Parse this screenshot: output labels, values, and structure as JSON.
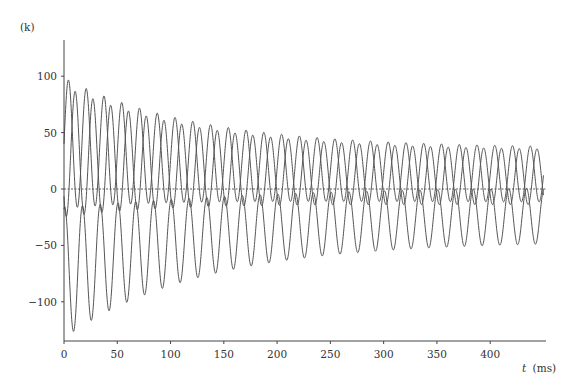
{
  "chart_data": {
    "type": "line",
    "title": "",
    "ylabel": "(k)",
    "xlabel_italic": "t",
    "xlabel_unit": "(ms)",
    "xlim": [
      0,
      450
    ],
    "ylim": [
      -135,
      132
    ],
    "x_ticks": [
      0,
      50,
      100,
      150,
      200,
      250,
      300,
      350,
      400
    ],
    "y_ticks": [
      100,
      50,
      0,
      -50,
      -100
    ],
    "x_tick_labels": [
      "0",
      "50",
      "100",
      "150",
      "200",
      "250",
      "300",
      "350",
      "400"
    ],
    "y_tick_labels": [
      "100",
      "50",
      "0",
      "−50",
      "−100"
    ],
    "zero_line": "dashed",
    "grid": false,
    "legend": null,
    "period_ms": 16.67,
    "series": [
      {
        "name": "phase-a",
        "peak_time_ms": 4.2,
        "peaks_start_end": [
          98,
          37
        ],
        "troughs_start_end": [
          -22,
          -14
        ]
      },
      {
        "name": "phase-b",
        "peak_time_ms": 10.5,
        "peaks_start_end": [
          92,
          37
        ],
        "troughs_start_end": [
          -20,
          -14
        ]
      },
      {
        "name": "phase-c",
        "trough_time_ms": 9.0,
        "troughs_start_end": [
          -128,
          -50
        ],
        "peaks_start_end": [
          -18,
          -2
        ]
      }
    ],
    "envelope_samples": {
      "t": [
        0,
        50,
        100,
        150,
        200,
        250,
        300,
        350,
        400,
        450
      ],
      "upper_peaks": [
        98,
        79,
        69,
        63,
        56,
        51,
        48,
        45,
        42,
        38
      ],
      "lower_troughs": [
        -128,
        -110,
        -95,
        -85,
        -75,
        -67,
        -61,
        -56,
        -52,
        -48
      ]
    }
  },
  "colors": {
    "line": "#555555",
    "axis": "#444444",
    "zero": "#333333"
  }
}
